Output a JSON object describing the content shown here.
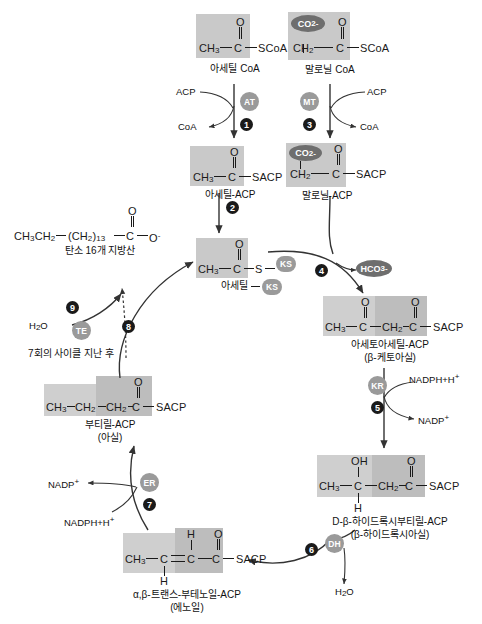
{
  "diagram": {
    "colors": {
      "highlight_box": "#c9c9c9",
      "highlight_box_light": "#cfcfcf",
      "enzyme_circle": "#9a9a9a",
      "step_bullet": "#1a1a1a",
      "dark_oval": "#6e6e6e",
      "text": "#1a1a1a",
      "arrow": "#333333"
    }
  },
  "molecules": {
    "acetyl_coa": {
      "label": "아세틸 CoA",
      "carbonyl_o": "O",
      "left": "CH",
      "left_sub": "3",
      "center": "C",
      "right": "SCoA"
    },
    "malonyl_coa": {
      "label": "말로닐 CoA",
      "co2": "CO",
      "co2_sub": "2",
      "co2_sup": "-",
      "carbonyl_o": "O",
      "left": "CH",
      "left_sub": "2",
      "center": "C",
      "right": "SCoA"
    },
    "acetyl_acp": {
      "label": "아세틸-ACP",
      "carbonyl_o": "O",
      "left": "CH",
      "left_sub": "3",
      "center": "C",
      "right": "SACP"
    },
    "malonyl_acp": {
      "label": "말로닐-ACP",
      "co2": "CO",
      "co2_sub": "2",
      "co2_sup": "-",
      "carbonyl_o": "O",
      "left": "CH",
      "left_sub": "2",
      "center": "C",
      "right": "SACP"
    },
    "acetyl_ks": {
      "label": "아세틸",
      "badge": "KS",
      "carbonyl_o": "O",
      "left": "CH",
      "left_sub": "3",
      "center": "C",
      "s": "S",
      "ks_badge": "KS"
    },
    "acetoacetyl_acp": {
      "label": "아세토아세틸-ACP",
      "sublabel": "(β-케토아실)",
      "o1": "O",
      "o2": "O",
      "a1": "CH",
      "a1_sub": "3",
      "a2": "C",
      "a3": "CH",
      "a3_sub": "2",
      "a4": "C",
      "right": "SACP"
    },
    "hydroxybutyryl_acp": {
      "label": "D-β-하이드록시부티릴-ACP",
      "sublabel": "(β-하이드록시아실)",
      "oh": "OH",
      "h": "H",
      "o": "O",
      "a1": "CH",
      "a1_sub": "3",
      "a2": "C",
      "a3": "CH",
      "a3_sub": "2",
      "a4": "C",
      "right": "SACP"
    },
    "butenoyl_acp": {
      "label": "α,β-트랜스-부테노일-ACP",
      "sublabel": "(에노일)",
      "h_top": "H",
      "h_bottom": "H",
      "o": "O",
      "a1": "CH",
      "a1_sub": "3",
      "a2": "C",
      "a3": "C",
      "a4": "C",
      "right": "SACP"
    },
    "butyryl_acp": {
      "label": "부티릴-ACP",
      "sublabel": "(아실)",
      "o": "O",
      "a1": "CH",
      "a1_sub": "3",
      "a2": "CH",
      "a2_sub": "2",
      "a3": "CH",
      "a3_sub": "2",
      "a4": "C",
      "right": "SACP"
    },
    "fatty_acid": {
      "label": "탄소 16개 지방산",
      "o": "O",
      "a1": "CH",
      "a1_sub": "3",
      "a2": "CH",
      "a2_sub": "2",
      "chain": "(CH",
      "chain_sub": "2",
      "chain_n": ")",
      "chain_n_sub": "13",
      "a4": "C",
      "right": "O",
      "right_sup": "-"
    }
  },
  "enzymes": [
    {
      "id": "AT",
      "name": "acetyl-transacylase"
    },
    {
      "id": "MT",
      "name": "malonyl-transacylase"
    },
    {
      "id": "KS",
      "name": "ketoacyl-synthase"
    },
    {
      "id": "KR",
      "name": "ketoacyl-reductase"
    },
    {
      "id": "DH",
      "name": "dehydratase"
    },
    {
      "id": "ER",
      "name": "enoyl-reductase"
    },
    {
      "id": "TE",
      "name": "thioesterase"
    }
  ],
  "steps": [
    {
      "number": "1",
      "enzyme": "AT"
    },
    {
      "number": "2",
      "enzyme": ""
    },
    {
      "number": "3",
      "enzyme": "MT"
    },
    {
      "number": "4",
      "enzyme": "KS"
    },
    {
      "number": "5",
      "enzyme": "KR"
    },
    {
      "number": "6",
      "enzyme": "DH"
    },
    {
      "number": "7",
      "enzyme": "ER"
    },
    {
      "number": "8",
      "enzyme": ""
    },
    {
      "number": "9",
      "enzyme": "TE"
    }
  ],
  "cofactors": {
    "acp_in_1": "ACP",
    "coa_out_1": "CoA",
    "acp_in_3": "ACP",
    "coa_out_3": "CoA",
    "hco3": "HCO",
    "hco3_sub": "3",
    "hco3_sup": "-",
    "nadph_5": "NADPH+H",
    "nadph_5_sup": "+",
    "nadp_5": "NADP",
    "nadp_5_sup": "+",
    "h2o_6": "H",
    "h2o_6_sub": "2",
    "h2o_6_rest": "O",
    "nadph_7": "NADPH+H",
    "nadph_7_sup": "+",
    "nadp_7": "NADP",
    "nadp_7_sup": "+",
    "h2o_9": "H",
    "h2o_9_sub": "2",
    "h2o_9_rest": "O"
  },
  "annotations": {
    "cycle_note": "7회의 사이클 지난 후"
  }
}
